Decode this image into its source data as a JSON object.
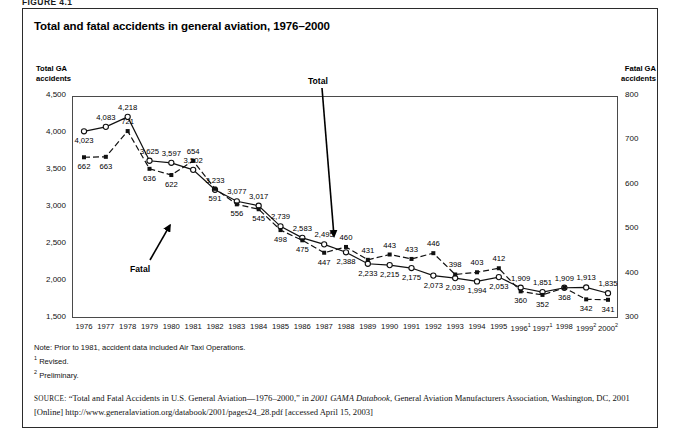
{
  "figure_caption": "FIGURE 4.1",
  "title": "Total and fatal accidents in general aviation, 1976–2000",
  "axis_caption_left": "Total GA\naccidents",
  "axis_caption_left_line1": "Total GA",
  "axis_caption_left_line2": "accidents",
  "axis_caption_right_line1": "Fatal GA",
  "axis_caption_right_line2": "accidents",
  "annotations": {
    "total": "Total",
    "fatal": "Fatal"
  },
  "notes": {
    "note": "Note: Prior to 1981, accident data included Air Taxi Operations.",
    "footnote1": "Revised.",
    "footnote2": "Preliminary.",
    "marker1": "1",
    "marker2": "2"
  },
  "source": {
    "label": "source:",
    "text_part1": "“Total and Fatal Accidents in U.S. General Aviation—1976–2000,” in ",
    "italic1": "2001 GAMA Databook",
    "text_part2": ", General Aviation Manufacturers Association, Washington, DC, 2001 [Online] http://www.generalaviation.org/databook/2001/pages24_28.pdf [accessed April 15, 2003]"
  },
  "chart_data": {
    "type": "line",
    "title": "Total and fatal accidents in general aviation, 1976–2000",
    "xlabel": "",
    "ylabel": "Total GA accidents",
    "y2label": "Fatal GA accidents",
    "ylim": [
      1500,
      4500
    ],
    "y2lim": [
      300,
      800
    ],
    "yticks": [
      "1,500",
      "2,000",
      "2,500",
      "3,000",
      "3,500",
      "4,000",
      "4,500"
    ],
    "ytick_values": [
      1500,
      2000,
      2500,
      3000,
      3500,
      4000,
      4500
    ],
    "y2ticks": [
      "300",
      "400",
      "500",
      "600",
      "700",
      "800"
    ],
    "y2tick_values": [
      300,
      400,
      500,
      600,
      700,
      800
    ],
    "grid": false,
    "legend": "inline-annotations",
    "categories": [
      "1976",
      "1977",
      "1978",
      "1979",
      "1980",
      "1981",
      "1982",
      "1983",
      "1984",
      "1985",
      "1986",
      "1987",
      "1988",
      "1989",
      "1990",
      "1991",
      "1992",
      "1993",
      "1994",
      "1995",
      "1996",
      "1997",
      "1998",
      "1999",
      "2000"
    ],
    "category_markers": [
      "",
      "",
      "",
      "",
      "",
      "",
      "",
      "",
      "",
      "",
      "",
      "",
      "",
      "",
      "",
      "",
      "",
      "",
      "",
      "",
      "1",
      "1",
      "",
      "2",
      "2"
    ],
    "series": [
      {
        "name": "Total",
        "axis": "left",
        "values": [
          4023,
          4083,
          4218,
          3625,
          3597,
          3502,
          3233,
          3077,
          3017,
          2739,
          2583,
          2495,
          2388,
          2233,
          2215,
          2175,
          2073,
          2039,
          1994,
          2053,
          1909,
          1851,
          1909,
          1913,
          1835
        ],
        "labels": [
          "4,023",
          "4,083",
          "4,218",
          "3,625",
          "3,597",
          "3,502",
          "3,233",
          "3,077",
          "3,017",
          "2,739",
          "2,583",
          "2,495",
          "2,388",
          "2,233",
          "2,215",
          "2,175",
          "2,073",
          "2,039",
          "1,994",
          "2,053",
          "1,909",
          "1,851",
          "1,909",
          "1,913",
          "1,835"
        ]
      },
      {
        "name": "Fatal",
        "axis": "right",
        "values": [
          662,
          663,
          721,
          636,
          622,
          654,
          591,
          556,
          545,
          498,
          475,
          447,
          460,
          431,
          443,
          433,
          446,
          398,
          403,
          412,
          360,
          352,
          368,
          342,
          341
        ],
        "labels": [
          "662",
          "663",
          "721",
          "636",
          "622",
          "654",
          "591",
          "556",
          "545",
          "498",
          "475",
          "447",
          "460",
          "431",
          "443",
          "433",
          "446",
          "398",
          "403",
          "412",
          "360",
          "352",
          "368",
          "342",
          "341"
        ]
      }
    ]
  }
}
